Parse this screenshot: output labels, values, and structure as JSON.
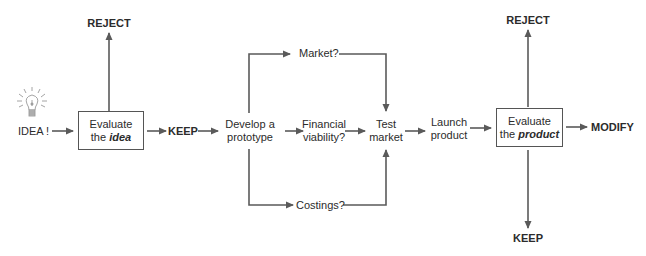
{
  "diagram": {
    "type": "flowchart",
    "title": "",
    "colors": {
      "line": "#5a5a5a",
      "text": "#2b2b2b",
      "box_border": "#555555",
      "bulb": "#9a9a9a"
    },
    "start": {
      "icon": "lightbulb-icon",
      "label": "IDEA !"
    },
    "evaluate_idea": {
      "line1": "Evaluate",
      "line2_prefix": "the ",
      "line2_emphasis": "idea",
      "reject_label": "REJECT",
      "keep_label": "KEEP"
    },
    "prototype": {
      "line1": "Develop a",
      "line2": "prototype"
    },
    "branches": {
      "market": "Market?",
      "financial_line1": "Financial",
      "financial_line2": "viability?",
      "costings": "Costings?"
    },
    "test_market": {
      "line1": "Test",
      "line2": "market"
    },
    "launch": {
      "line1": "Launch",
      "line2": "product"
    },
    "evaluate_product": {
      "line1": "Evaluate",
      "line2_prefix": "the ",
      "line2_emphasis": "product",
      "reject_label": "REJECT",
      "modify_label": "MODIFY",
      "keep_label": "KEEP"
    }
  }
}
